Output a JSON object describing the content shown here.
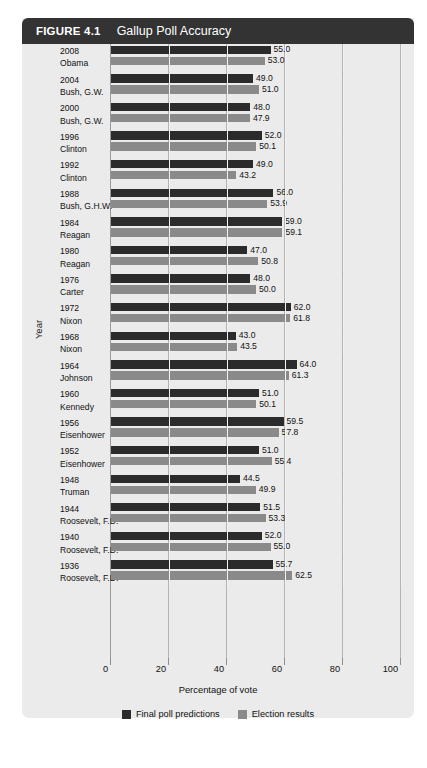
{
  "figure": {
    "number": "FIGURE 4.1",
    "title": "Gallup Poll Accuracy"
  },
  "colors": {
    "header_bg": "#333333",
    "body_bg": "#ebebeb",
    "prediction_bar": "#2b2b2b",
    "result_bar": "#8a8a8a",
    "gridline": "#b4b4b4"
  },
  "legend": {
    "items": [
      {
        "label": "Final poll predictions",
        "color": "#2b2b2b"
      },
      {
        "label": "Election results",
        "color": "#8a8a8a"
      }
    ]
  },
  "chart_data": {
    "type": "bar",
    "orientation": "horizontal",
    "title": "Gallup Poll Accuracy",
    "xlabel": "Percentage of vote",
    "ylabel": "Year",
    "xlim": [
      0,
      100
    ],
    "xticks": [
      0,
      20,
      40,
      60,
      80,
      100
    ],
    "xticklabels": [
      "0",
      "20",
      "40",
      "60",
      "80",
      "100"
    ],
    "grid": "vertical",
    "legend_position": "bottom-center",
    "categories": [
      "2008 Obama",
      "2004 Bush, G.W.",
      "2000 Bush, G.W.",
      "1996 Clinton",
      "1992 Clinton",
      "1988 Bush, G.H.W.",
      "1984 Reagan",
      "1980 Reagan",
      "1976 Carter",
      "1972 Nixon",
      "1968 Nixon",
      "1964 Johnson",
      "1960 Kennedy",
      "1956 Eisenhower",
      "1952 Eisenhower",
      "1948 Truman",
      "1944 Roosevelt, F.D.",
      "1940 Roosevelt, F.D.",
      "1936 Roosevelt, F.D."
    ],
    "series": [
      {
        "name": "Final poll predictions",
        "color": "#2b2b2b",
        "values": [
          55.0,
          49.0,
          48.0,
          52.0,
          49.0,
          56.0,
          59.0,
          47.0,
          48.0,
          62.0,
          43.0,
          64.0,
          51.0,
          59.5,
          51.0,
          44.5,
          51.5,
          52.0,
          55.7
        ]
      },
      {
        "name": "Election results",
        "color": "#8a8a8a",
        "values": [
          53.0,
          51.0,
          47.9,
          50.1,
          43.2,
          53.9,
          59.1,
          50.8,
          50.0,
          61.8,
          43.5,
          61.3,
          50.1,
          57.8,
          55.4,
          49.9,
          53.3,
          55.0,
          62.5
        ]
      }
    ],
    "rows": [
      {
        "year": "2008",
        "candidate": "Obama",
        "prediction": 55.0,
        "result": 53.0,
        "prediction_label": "55.0",
        "result_label": "53.0"
      },
      {
        "year": "2004",
        "candidate": "Bush, G.W.",
        "prediction": 49.0,
        "result": 51.0,
        "prediction_label": "49.0",
        "result_label": "51.0"
      },
      {
        "year": "2000",
        "candidate": "Bush, G.W.",
        "prediction": 48.0,
        "result": 47.9,
        "prediction_label": "48.0",
        "result_label": "47.9"
      },
      {
        "year": "1996",
        "candidate": "Clinton",
        "prediction": 52.0,
        "result": 50.1,
        "prediction_label": "52.0",
        "result_label": "50.1"
      },
      {
        "year": "1992",
        "candidate": "Clinton",
        "prediction": 49.0,
        "result": 43.2,
        "prediction_label": "49.0",
        "result_label": "43.2"
      },
      {
        "year": "1988",
        "candidate": "Bush, G.H.W.",
        "prediction": 56.0,
        "result": 53.9,
        "prediction_label": "56.0",
        "result_label": "53.9"
      },
      {
        "year": "1984",
        "candidate": "Reagan",
        "prediction": 59.0,
        "result": 59.1,
        "prediction_label": "59.0",
        "result_label": "59.1"
      },
      {
        "year": "1980",
        "candidate": "Reagan",
        "prediction": 47.0,
        "result": 50.8,
        "prediction_label": "47.0",
        "result_label": "50.8"
      },
      {
        "year": "1976",
        "candidate": "Carter",
        "prediction": 48.0,
        "result": 50.0,
        "prediction_label": "48.0",
        "result_label": "50.0"
      },
      {
        "year": "1972",
        "candidate": "Nixon",
        "prediction": 62.0,
        "result": 61.8,
        "prediction_label": "62.0",
        "result_label": "61.8"
      },
      {
        "year": "1968",
        "candidate": "Nixon",
        "prediction": 43.0,
        "result": 43.5,
        "prediction_label": "43.0",
        "result_label": "43.5"
      },
      {
        "year": "1964",
        "candidate": "Johnson",
        "prediction": 64.0,
        "result": 61.3,
        "prediction_label": "64.0",
        "result_label": "61.3"
      },
      {
        "year": "1960",
        "candidate": "Kennedy",
        "prediction": 51.0,
        "result": 50.1,
        "prediction_label": "51.0",
        "result_label": "50.1"
      },
      {
        "year": "1956",
        "candidate": "Eisenhower",
        "prediction": 59.5,
        "result": 57.8,
        "prediction_label": "59.5",
        "result_label": "57.8"
      },
      {
        "year": "1952",
        "candidate": "Eisenhower",
        "prediction": 51.0,
        "result": 55.4,
        "prediction_label": "51.0",
        "result_label": "55.4"
      },
      {
        "year": "1948",
        "candidate": "Truman",
        "prediction": 44.5,
        "result": 49.9,
        "prediction_label": "44.5",
        "result_label": "49.9"
      },
      {
        "year": "1944",
        "candidate": "Roosevelt, F.D.",
        "prediction": 51.5,
        "result": 53.3,
        "prediction_label": "51.5",
        "result_label": "53.3"
      },
      {
        "year": "1940",
        "candidate": "Roosevelt, F.D.",
        "prediction": 52.0,
        "result": 55.0,
        "prediction_label": "52.0",
        "result_label": "55.0"
      },
      {
        "year": "1936",
        "candidate": "Roosevelt, F.D.",
        "prediction": 55.7,
        "result": 62.5,
        "prediction_label": "55.7",
        "result_label": "62.5"
      }
    ]
  }
}
